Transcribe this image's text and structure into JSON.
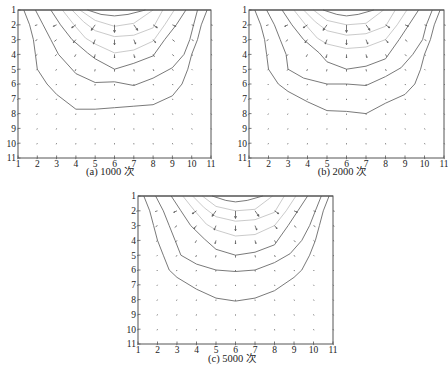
{
  "figure": {
    "panels": [
      {
        "id": "a",
        "caption": "(a) 1000 次",
        "box": {
          "left": 18,
          "top": 10,
          "right": 211,
          "bottom": 158
        }
      },
      {
        "id": "b",
        "caption": "(b) 2000 次",
        "box": {
          "left": 249,
          "top": 10,
          "right": 444,
          "bottom": 158
        }
      },
      {
        "id": "c",
        "caption": "(c) 5000 次",
        "box": {
          "left": 138,
          "top": 196,
          "right": 333,
          "bottom": 344
        }
      }
    ],
    "colors": {
      "dark_contour": "#6a6a6a",
      "light_contour": "#c4c4c4",
      "arrow": "#555555",
      "frame": "#555555"
    }
  },
  "chart_data": [
    {
      "type": "contour+quiver",
      "title": "(a) 1000 次",
      "xlabel": "",
      "ylabel": "",
      "xlim": [
        1,
        11
      ],
      "ylim": [
        11,
        1
      ],
      "xticks": [
        1,
        2,
        3,
        4,
        5,
        6,
        7,
        8,
        9,
        10,
        11
      ],
      "yticks": [
        1,
        2,
        3,
        4,
        5,
        6,
        7,
        8,
        9,
        10,
        11
      ],
      "grid": false,
      "contours_dark": [
        [
          [
            1.3,
            1
          ],
          [
            1.6,
            2
          ],
          [
            1.8,
            3
          ],
          [
            1.9,
            4
          ],
          [
            2,
            5
          ],
          [
            2.5,
            6
          ],
          [
            3,
            6.7
          ],
          [
            4,
            7.7
          ],
          [
            5,
            7.7
          ],
          [
            6,
            7.6
          ],
          [
            7,
            7.5
          ],
          [
            8,
            7.4
          ],
          [
            9,
            6.8
          ],
          [
            9.5,
            6
          ],
          [
            9.8,
            5
          ],
          [
            10,
            4
          ],
          [
            10.3,
            3
          ],
          [
            10.5,
            2
          ],
          [
            10.8,
            1
          ]
        ],
        [
          [
            1.9,
            1
          ],
          [
            2.3,
            2
          ],
          [
            2.7,
            3
          ],
          [
            3.1,
            4
          ],
          [
            4,
            5.3
          ],
          [
            5,
            5.9
          ],
          [
            6,
            5.85
          ],
          [
            7,
            6.1
          ],
          [
            8,
            5.6
          ],
          [
            9,
            4.9
          ],
          [
            9.6,
            4
          ],
          [
            9.9,
            3
          ],
          [
            10.1,
            2
          ],
          [
            10.3,
            1
          ]
        ],
        [
          [
            2.7,
            1
          ],
          [
            3.2,
            2
          ],
          [
            3.8,
            3
          ],
          [
            4.6,
            3.9
          ],
          [
            5,
            4.3
          ],
          [
            6,
            5
          ],
          [
            7,
            4.6
          ],
          [
            8,
            4.1
          ],
          [
            8.6,
            3
          ],
          [
            9.2,
            2
          ],
          [
            9.7,
            1
          ]
        ],
        [
          [
            4.6,
            1
          ],
          [
            5.3,
            1.3
          ],
          [
            6,
            1.4
          ],
          [
            6.7,
            1.3
          ],
          [
            7.6,
            1
          ]
        ]
      ],
      "contours_light": [
        [
          [
            3.3,
            1
          ],
          [
            3.9,
            2
          ],
          [
            4.5,
            2.9
          ],
          [
            5,
            3.3
          ],
          [
            6,
            3.9
          ],
          [
            7,
            3.7
          ],
          [
            8,
            3.1
          ],
          [
            8.6,
            2
          ],
          [
            9.1,
            1
          ]
        ],
        [
          [
            3.8,
            1
          ],
          [
            4.4,
            1.8
          ],
          [
            5,
            2.4
          ],
          [
            6,
            2.8
          ],
          [
            7,
            2.7
          ],
          [
            8,
            2.2
          ],
          [
            8.5,
            1
          ]
        ],
        [
          [
            4.2,
            1
          ],
          [
            5,
            1.7
          ],
          [
            6,
            2.1
          ],
          [
            7,
            1.9
          ],
          [
            8,
            1
          ]
        ]
      ],
      "quiver": "radial field emanating downward/outward from top-center (x=6, y=1); magnitude decreasing with depth"
    },
    {
      "type": "contour+quiver",
      "title": "(b) 2000 次",
      "xlabel": "",
      "ylabel": "",
      "xlim": [
        1,
        11
      ],
      "ylim": [
        11,
        1
      ],
      "xticks": [
        1,
        2,
        3,
        4,
        5,
        6,
        7,
        8,
        9,
        10,
        11
      ],
      "yticks": [
        1,
        2,
        3,
        4,
        5,
        6,
        7,
        8,
        9,
        10,
        11
      ],
      "grid": false,
      "contours_dark": [
        [
          [
            1.3,
            1
          ],
          [
            1.6,
            2
          ],
          [
            1.8,
            3
          ],
          [
            1.9,
            4
          ],
          [
            2,
            5
          ],
          [
            2.5,
            6
          ],
          [
            3,
            6.5
          ],
          [
            4,
            7.2
          ],
          [
            5,
            7.8
          ],
          [
            6,
            7.85
          ],
          [
            7,
            8
          ],
          [
            8,
            7.3
          ],
          [
            9,
            6.7
          ],
          [
            9.5,
            6
          ],
          [
            9.8,
            5
          ],
          [
            10,
            4
          ],
          [
            10.3,
            3
          ],
          [
            10.5,
            2
          ],
          [
            10.8,
            1
          ]
        ],
        [
          [
            1.9,
            1
          ],
          [
            2.3,
            2
          ],
          [
            2.6,
            3
          ],
          [
            2.9,
            4
          ],
          [
            3,
            5
          ],
          [
            3.8,
            5.6
          ],
          [
            5,
            6
          ],
          [
            6,
            6
          ],
          [
            7,
            6.1
          ],
          [
            8,
            5.5
          ],
          [
            8.8,
            4.9
          ],
          [
            9.4,
            4
          ],
          [
            9.9,
            3
          ],
          [
            10.1,
            2
          ],
          [
            10.4,
            1
          ]
        ],
        [
          [
            2.7,
            1
          ],
          [
            3.2,
            2
          ],
          [
            3.8,
            3
          ],
          [
            4.6,
            3.9
          ],
          [
            5,
            4.5
          ],
          [
            6,
            5
          ],
          [
            7,
            4.8
          ],
          [
            8,
            4.3
          ],
          [
            8.7,
            3
          ],
          [
            9.2,
            2
          ],
          [
            9.7,
            1
          ]
        ],
        [
          [
            4.8,
            1
          ],
          [
            5.5,
            1.3
          ],
          [
            6,
            1.4
          ],
          [
            6.6,
            1.3
          ],
          [
            7.4,
            1
          ]
        ]
      ],
      "contours_light": [
        [
          [
            3.3,
            1
          ],
          [
            3.9,
            2
          ],
          [
            4.5,
            2.9
          ],
          [
            5,
            3.3
          ],
          [
            6,
            3.6
          ],
          [
            7,
            3.5
          ],
          [
            8,
            3
          ],
          [
            8.6,
            2
          ],
          [
            9.1,
            1
          ]
        ],
        [
          [
            3.8,
            1
          ],
          [
            4.4,
            1.8
          ],
          [
            5,
            2.4
          ],
          [
            6,
            2.7
          ],
          [
            7,
            2.6
          ],
          [
            8,
            2.1
          ],
          [
            8.5,
            1
          ]
        ],
        [
          [
            4.3,
            1
          ],
          [
            5,
            1.7
          ],
          [
            6,
            2
          ],
          [
            7,
            1.9
          ],
          [
            7.9,
            1
          ]
        ]
      ],
      "quiver": "radial field emanating downward/outward from top-center (x=6, y=1); magnitude decreasing with depth"
    },
    {
      "type": "contour+quiver",
      "title": "(c) 5000 次",
      "xlabel": "",
      "ylabel": "",
      "xlim": [
        1,
        11
      ],
      "ylim": [
        11,
        1
      ],
      "xticks": [
        1,
        2,
        3,
        4,
        5,
        6,
        7,
        8,
        9,
        10,
        11
      ],
      "yticks": [
        1,
        2,
        3,
        4,
        5,
        6,
        7,
        8,
        9,
        10,
        11
      ],
      "grid": false,
      "contours_dark": [
        [
          [
            1.3,
            1
          ],
          [
            1.6,
            2
          ],
          [
            1.8,
            3
          ],
          [
            2,
            4
          ],
          [
            2.3,
            5
          ],
          [
            2.6,
            6
          ],
          [
            3,
            6.5
          ],
          [
            4,
            7.3
          ],
          [
            5,
            7.9
          ],
          [
            6,
            8.1
          ],
          [
            7,
            7.9
          ],
          [
            8,
            7.4
          ],
          [
            9,
            6.5
          ],
          [
            9.4,
            6
          ],
          [
            9.8,
            5
          ],
          [
            10.1,
            4
          ],
          [
            10.3,
            3
          ],
          [
            10.5,
            2
          ],
          [
            10.8,
            1
          ]
        ],
        [
          [
            1.9,
            1
          ],
          [
            2.3,
            2
          ],
          [
            2.6,
            3
          ],
          [
            2.9,
            4
          ],
          [
            3.2,
            5
          ],
          [
            4,
            5.6
          ],
          [
            5,
            6
          ],
          [
            6,
            6.1
          ],
          [
            7,
            6
          ],
          [
            8,
            5.5
          ],
          [
            8.8,
            4.9
          ],
          [
            9.4,
            4
          ],
          [
            9.8,
            3
          ],
          [
            10.1,
            2
          ],
          [
            10.4,
            1
          ]
        ],
        [
          [
            2.7,
            1
          ],
          [
            3.2,
            2
          ],
          [
            3.7,
            3
          ],
          [
            4.4,
            3.9
          ],
          [
            5,
            4.6
          ],
          [
            6,
            5
          ],
          [
            7,
            4.8
          ],
          [
            8,
            4.3
          ],
          [
            8.7,
            3
          ],
          [
            9.2,
            2
          ],
          [
            9.7,
            1
          ]
        ],
        [
          [
            4.8,
            1
          ],
          [
            5.5,
            1.3
          ],
          [
            6,
            1.4
          ],
          [
            6.6,
            1.3
          ],
          [
            7.4,
            1
          ]
        ]
      ],
      "contours_light": [
        [
          [
            3.3,
            1
          ],
          [
            3.9,
            2
          ],
          [
            4.5,
            2.9
          ],
          [
            5,
            3.3
          ],
          [
            6,
            3.7
          ],
          [
            7,
            3.6
          ],
          [
            8,
            3
          ],
          [
            8.6,
            2
          ],
          [
            9.1,
            1
          ]
        ],
        [
          [
            3.8,
            1
          ],
          [
            4.4,
            1.8
          ],
          [
            5,
            2.4
          ],
          [
            6,
            2.7
          ],
          [
            7,
            2.6
          ],
          [
            8,
            2.1
          ],
          [
            8.5,
            1
          ]
        ],
        [
          [
            4.3,
            1
          ],
          [
            5,
            1.7
          ],
          [
            6,
            2
          ],
          [
            7,
            1.9
          ],
          [
            7.9,
            1
          ]
        ]
      ],
      "quiver": "radial field emanating downward/outward from top-center (x=6, y=1); magnitude decreasing with depth"
    }
  ]
}
